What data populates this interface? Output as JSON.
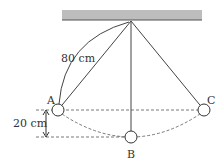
{
  "diagram": {
    "type": "pendulum",
    "ceiling": {
      "color": "#bdbdbd",
      "edge": "#555555"
    },
    "pivot": {
      "x": 131,
      "y": 21
    },
    "points": [
      {
        "id": "A",
        "label": "A",
        "x": 58,
        "y": 110
      },
      {
        "id": "B",
        "label": "B",
        "x": 131,
        "y": 137
      },
      {
        "id": "C",
        "label": "C",
        "x": 204,
        "y": 110
      }
    ],
    "length_label": "80 cm",
    "height_label": "20 cm"
  }
}
